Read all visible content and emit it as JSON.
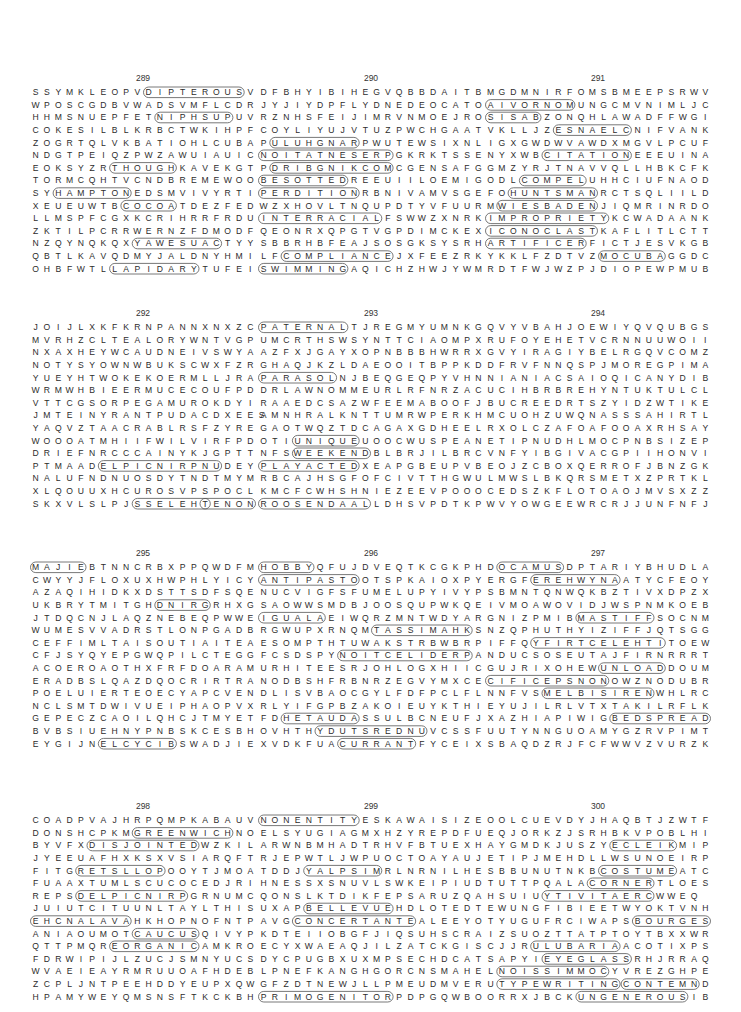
{
  "page": {
    "puzzles": [
      {
        "number": "289",
        "rows": [
          "SSYMKLEOPVDIPTEROUSV",
          "WPOSCGDBVWADSVMFLCDR",
          "HHMSNUEPFETNIPHSUPUV",
          "COKESILBLKRBCTWKIHPF",
          "ZOGRTQLVKBATIOHLCUBA",
          "NDGTPEIQZPWZAWUIAUIC",
          "EOKSYZRTHOUGHKAVEKGT",
          "TORMCQHTVCNDBREMEWOO",
          "SYHAMPTONEDSMVIVYRTI",
          "XEUEUWTBCOCOATDEZFED",
          "LLMSPFCGXKCRIHRRFRDU",
          "ZKTILPCRRWERNZFDMODF",
          "NZQYNQKQXYAWESUACTYY",
          "QBTLKAVQDMYJALDNYHMI",
          "OHBFWTLLAPIDARYTUFEI"
        ],
        "found_words": [
          "DIPTEROUS",
          "NIPHSUP",
          "THOUGH",
          "HAMPTON",
          "COCOA",
          "YAWESUAC",
          "LAPIDARY"
        ]
      },
      {
        "number": "290",
        "rows": [
          "DFBHYIBIHEGVQBBDAITB",
          "JYJIYDPFLYDNEDEOCATO",
          "RZNHSFEIJIMRVNMOEJRO",
          "COYLIYUJVTUZPWCHGAAT",
          "PULUHGNARPWUTEWSIXNL",
          "NOITATNESERPGKRKTSSE",
          "PDRIBGNIKCOMCGENSAFG",
          "BESOTTEDREEUIILOEMIG",
          "PERDITIONRBNIVAMVSGE",
          "WZXHOVLTNQUPDTYVFUUR",
          "INTERRACIALFSWWZXNRK",
          "QEONRXQPGTVGPDIMCKEX",
          "SBBRHBFEAJSOSGKSYSRH",
          "LFCOMPLIANCEJXFEEZRK",
          "SWIMMINGAQICHZHWJYWM"
        ],
        "found_words": [
          "ULUHGNAR",
          "NOITATNESERP",
          "DRIBGNIKCOM",
          "BESOTTED",
          "PERDITION",
          "INTERRACIAL",
          "COMPLIANCE",
          "SWIMMING"
        ]
      },
      {
        "number": "291",
        "rows": [
          "MGDMNIRFOMSBMEEPSRWV",
          "AIVORNOMUNGCMVNIMLJC",
          "SISABZONQHLAWADFFWGI",
          "VKLLJZESNAELCNIFVANK",
          "IGXGWDWVAWDXMGVLPCUF",
          "NYXWBCITATIONEEEUINA",
          "GMZYRJTNAVVQLLHBKCFK",
          "ODLCOMPELUHHCIUFNAOD",
          "FOHUNTSMANRCTSQLIILD",
          "MWIESBADENJIQMRINRDO",
          "IMPROPRIETYKCWADAANK",
          "ICONOCLASTKAFLITLCTT",
          "ARTIFICERFICTJESVKGB",
          "YKKLFZDTVZMOCUBAGGDC",
          "RDTFWJWZPJDIOPEWPMUB"
        ],
        "found_words": [
          "AIVORNOM",
          "SISAB",
          "ESNAELC",
          "CITATION",
          "COMPEL",
          "HUNTSMAN",
          "WIESBADEN",
          "IMPROPRIETY",
          "ICONOCLAST",
          "ARTIFICER",
          "MOCUBA"
        ]
      },
      {
        "number": "292",
        "rows": [
          "JOIJLXKFKRNPANNXNXZC",
          "MVRHZCLTEALORYWNTVGP",
          "NXAXHEYWCAUDNEIVSWYA",
          "NOTYSYOWNWBUKSCWXFZR",
          "YUEYHTWOKEKOERMLLJRA",
          "WRMWHBIEERMUCECOUFPD",
          "VTTCGSORPEGAMUROKDYI",
          "JMTEINYRANTPUDACDXEES",
          "YAQVZTAACRABLRSFZYRE",
          "WOOOATMHIIFWILVIRFPD",
          "DRIEFNRCCCAINYKJGPTT",
          "PTMAADELPICNIRPNUDEY",
          "NALUFNDNUOSDYTNDTMYM",
          "XLQOUUXHCUROSVPSPOCL",
          "SKXVLSLPJSSELEHTENON"
        ],
        "found_words": [
          "ELPICNIRPNU",
          "SSELEHT",
          "TENON"
        ]
      },
      {
        "number": "293",
        "rows": [
          "PATERNALTJREGMYUMNKG",
          "UMCRTHSWSYNTTCIAOMPX",
          "AZFXJGAYXOPNBBBHWRRX",
          "GHAQJKZLDAEOOITBPPKD",
          "PARASOLNJBEQGEQPYVHN",
          "DRLAWNOMMEURLRFNRZAC",
          "RAAEDCSAZWFEEMABOOFJ",
          "AMNHRALKNTTUMRWPERKH",
          "GAOTWQZTDCAGAXGDHEEL",
          "OTIUNIQUEUOOCWUSPEAN",
          "NFSWEEKENDBLBRJILBRC",
          "PLAYACTEDXEAPGBEUPVB",
          "RBCAJHSGFOFCIVTTHGWU",
          "KMCFCWHSHNIEZEEVPOOO",
          "ROOSENDAALLDHSVPDTKP"
        ],
        "found_words": [
          "PATERNAL",
          "PARASOL",
          "UNIQUE",
          "WEEKEND",
          "PLAYACTED",
          "ROOSENDAAL"
        ]
      },
      {
        "number": "294",
        "rows": [
          "QVYVBAHJOEWIYQVQUBGS",
          "RUFOYEHETVCRNNUUWOII",
          "GVYIRAGIYBELRGQVCOMZ",
          "DFRVFNNQSPJMOREGPIMA",
          "NIANIACSAIOQICANYDIB",
          "UCIHBRBREHYNTUKTULCL",
          "BUCREEDRTSZYIDZWTIKE",
          "MCUOHZUWQNASSSAHIRTL",
          "RXOLCZAFOAFOOAXRHSAY",
          "ETIPNUDHLMOCPNBSIZEP",
          "VNFYIBGIVACGPIIHONVI",
          "EOJZCBOXQERROFJBNZGK",
          "LMWSLBKQRSMETXZPRTKL",
          "CEDSZKFLOTOAOJMVSXZZ",
          "WVYOWGEEWRCRJJUNFNFJ"
        ],
        "found_words": []
      },
      {
        "number": "295",
        "rows": [
          "MAJIEBTNNCRBXPPQWDFM",
          "CWYYJFLOXUXHWPHLYICY",
          "AZAQIHIDKXDSTTSDFSQE",
          "UKBRYTMITGHDNIRGRHXG",
          "JTDQCNJLAQZNEBEQPWWE",
          "WUMESVVADRSTLONPGADB",
          "CEFFIMLTAISOUTIAITEA",
          "CFJSYQYEPGWQPILCTEGG",
          "ACOEROAOTHXFRFDOARAM",
          "ERADBSLQAZDQOCRIRTRA",
          "POELUIERTEOECYAPCVEN",
          "NCLSMTDWIVUEIPHAOPVX",
          "GEPECZCAOILQHCJTMYET",
          "BVBSIUEHNYPNBSKCESBH",
          "EYGIJNELCYCIBSWADJIE"
        ],
        "found_words": [
          "MAJIE",
          "DNIRG",
          "ELCYCIB"
        ]
      },
      {
        "number": "296",
        "rows": [
          "HOBBYQFUJDVEQTKCGKPH",
          "ANTIPASTOOTSPKAIOXPY",
          "NUCVIGFSFUMELUPYIVYP",
          "SAOWWSMDBJOOSQUPWKQE",
          "IGUALAEIWQRZMNTWDYAR",
          "RGWUPXRNQMTASSIMAHKS",
          "ESOMPTHTUWAKSTRBWBRP",
          "FCSDSPYNOITCELIDERPA",
          "URHITEESRJOHLOGXHIIC",
          "NODBSHFRBNRZEGVYMXCE",
          "DLISVBAOCGYLFDFPCLFL",
          "RLYIFGPBZAKOIEUYKTHI",
          "FDHETAUDASSULBCNEUFJ",
          "OVHTHYDUTSREDNUVCSSF",
          "XVDKFUACURRANTFYCEIX"
        ],
        "found_words": [
          "HOBBY",
          "ANTIPASTO",
          "IGUALA",
          "TASSIMAHK",
          "NOITCELIDERP",
          "HETAUDA",
          "YDUTSREDNU",
          "CURRANT"
        ]
      },
      {
        "number": "297",
        "rows": [
          "DOCAMUSDPTARIYBHUDLA",
          "ERGFEREHWYNAATYCFEOY",
          "SBMNTQNWQKBZTIVXDPZX",
          "IVMOAWOVIDJWSPNMKOEB",
          "GNIZPMIBMASTIFFSOCNM",
          "NZQPHUTHYIZIFFJQTSGG",
          "IFFQYFIRTCELEHTITOEW",
          "NDUCSOSEUTAJFIRNRRRT",
          "GUJRIXOHEWUNLOADDOUM",
          "CIFICEPSNONOWZNODUBR",
          "NNFVSMELBISIRENWHLRC",
          "EYUJILRLVTXTAKILRFLK",
          "XAZHIAPIWIGBEDSPREAD",
          "UUTYNNGUOAMYGZRVPIMT",
          "SBAQDZRJFCFWWVZVURZK"
        ],
        "found_words": [
          "OCAMUS",
          "EREHWYNA",
          "MASTIFF",
          "YFIRTCELEHTI",
          "UNLOAD",
          "CIFICEPSNON",
          "MELBISIREN",
          "BEDSPREAD"
        ]
      },
      {
        "number": "298",
        "rows": [
          "COADPVAJHRPQMPKABAUV",
          "DONSHCPKMGREENWICHNO",
          "BYVFXDISJOINTEDWZKIL",
          "JYEEUAFHXKSXVSIARQFT",
          "FITGRETSLLOPOOYTJMOA",
          "FUAAXTUMLSCUCOCEDJRI",
          "REPSDELPICNIRPGRNUMC",
          "JUIUTCITUUNLTAYLTHIS",
          "EHCNALAVAHKHOPNOFNTP",
          "ANIAOUMOTCAUCUSQIVYP",
          "QTTPMQREORGANICAMKRO",
          "FDRWIPIJLZUCJSMNYUCS",
          "WVAEIEAYRMRUUOAFHDEB",
          "ZCPLJNTPEEHDDYEUPXQW",
          "HPAMYWEYQMSNSFTKCKBH"
        ],
        "found_words": [
          "GREENWICH",
          "DISJOINTED",
          "RETSLLOP",
          "DELPICNIRP",
          "EHCNALAVA",
          "CAUCUS",
          "EORGANIC"
        ]
      },
      {
        "number": "299",
        "rows": [
          "NONENTITYESKAWAISIZE",
          "ELSYUGIAGMXHZYREPDFU",
          "ARWNBMHADTRHVFBTUEXH",
          "RJEPWTLJWPUOCTOAYAUJ",
          "TDDJYALPSIMRLNRNILHE",
          "HNESSXSNUVLSWKEIPIUD",
          "QONSLKTDIKFEPSARUZQA",
          "UXAPBELLEVUEHDLOTEDT",
          "AVGCONCERTANTEALEEYO",
          "KDTEIIOBGFJIQSUHSCRA",
          "ECYXWAEAQJILZATCKGIS",
          "DYCPUGBXUXMPSECHDCAT",
          "LPNEFKANGHGORCNSMAHE",
          "GFZDTNEWJLLPMEUDMVER",
          "PRIMOGENITORPDPGQWBO"
        ],
        "found_words": [
          "NONENTITY",
          "YALPSIM",
          "BELLEVUE",
          "CONCERTANTE",
          "PRIMOGENITOR"
        ]
      },
      {
        "number": "300",
        "rows": [
          "OOLCUEVDYJHAQBTJZWTF",
          "EQJORKZJSRHBKVPOBLHI",
          "AYGMDKJUSZYECLEIKMIP",
          "ETIPJMEHDLLWSUNOEIRP",
          "SBBUNUTNKBCOSTUMEATC",
          "TUTTPQALACORNERTLOES",
          "HSUIUYTIVITAERCWWEQ",
          "EWUNGFIBIEETWYOKTVNH",
          "TYUGUFRCIWAPSBOURGES",
          "IZSUOZTTATPTOYTBXXWR",
          "CJJRULUBARIAACOTIXPS",
          "SAPYIEYEGLASSRHJRRAQ",
          "LNOISSIMMOCYVREZGHPE",
          "UTYPEWRITINGCONTEMND",
          "ORRXJBCKUNGENEROUSIB"
        ],
        "found_words": [
          "ECLEIK",
          "COSTUME",
          "CORNER",
          "YTIVITAERC",
          "BOURGES",
          "ULUBARIA",
          "EYEGLASS",
          "NOISSIMMOC",
          "TYPEWRITING",
          "CONTEMN",
          "UNGENEROUS"
        ]
      }
    ]
  }
}
